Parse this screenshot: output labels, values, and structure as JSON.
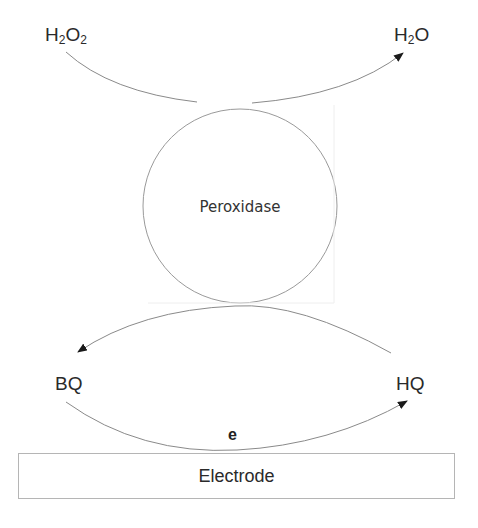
{
  "diagram": {
    "type": "electrochemical biosensor mechanism",
    "nodes": {
      "substrate": {
        "main": "H",
        "sub1": "2",
        "mid": "O",
        "sub2": "2"
      },
      "product": {
        "main": "H",
        "sub1": "2",
        "mid": "O"
      },
      "enzyme": "Peroxidase",
      "oxidized_mediator": "BQ",
      "reduced_mediator": "HQ",
      "electron": "e",
      "electrode": "Electrode"
    },
    "edges": [
      {
        "from": "H2O2",
        "to": "H2O",
        "via": "Peroxidase",
        "arrow": "to-H2O"
      },
      {
        "from": "HQ",
        "to": "BQ",
        "via": "Peroxidase",
        "arrow": "to-BQ"
      },
      {
        "from": "BQ",
        "to": "HQ",
        "via": "Electrode",
        "label": "e",
        "arrow": "to-HQ"
      }
    ],
    "colors": {
      "line": "#8a8a8a",
      "arrowhead": "#1a1a1a",
      "text": "#2a2a2a",
      "box_border": "#b5b5b5"
    }
  }
}
